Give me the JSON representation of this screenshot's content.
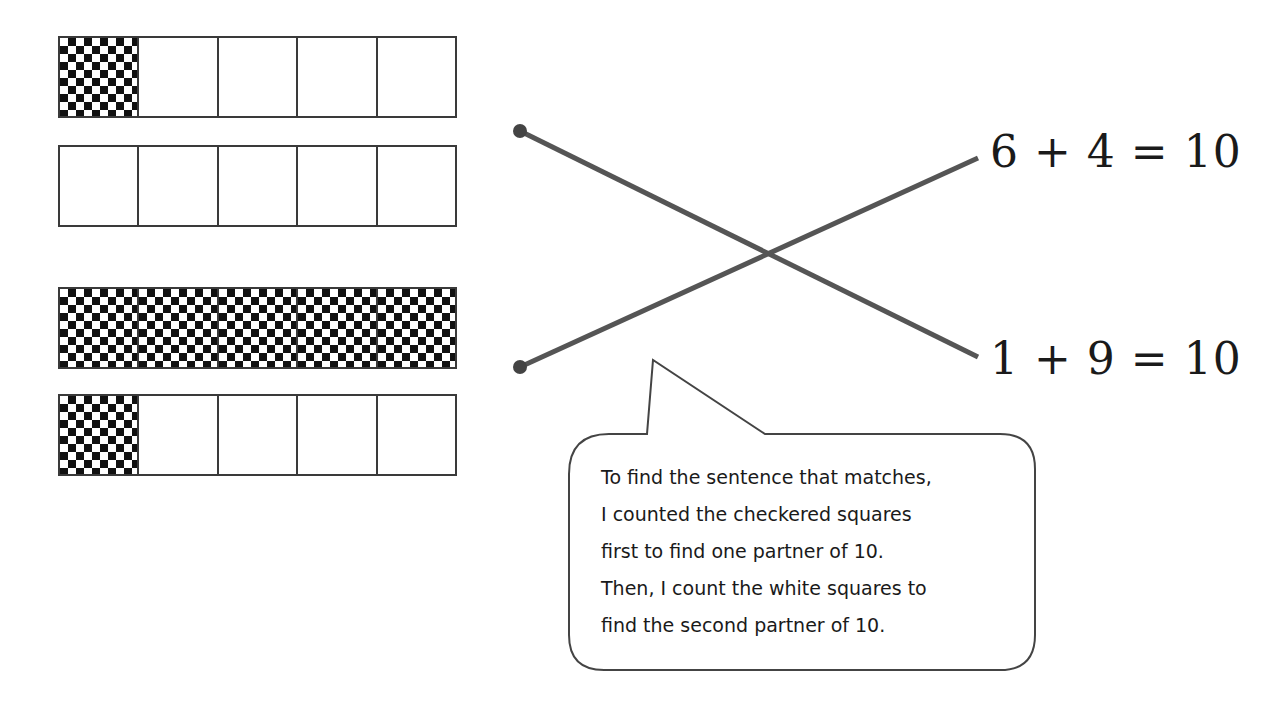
{
  "ten_frames": [
    {
      "id": "frame-1",
      "top": 36,
      "cells": [
        "checkered",
        "white",
        "white",
        "white",
        "white"
      ],
      "checkered_count": 1,
      "white_count": 4
    },
    {
      "id": "frame-2",
      "top": 145,
      "cells": [
        "white",
        "white",
        "white",
        "white",
        "white"
      ],
      "checkered_count": 0,
      "white_count": 5
    },
    {
      "id": "frame-3",
      "top": 287,
      "cells": [
        "checkered",
        "checkered",
        "checkered",
        "checkered",
        "checkered"
      ],
      "checkered_count": 5,
      "white_count": 0
    },
    {
      "id": "frame-4",
      "top": 394,
      "cells": [
        "checkered",
        "white",
        "white",
        "white",
        "white"
      ],
      "checkered_count": 1,
      "white_count": 4
    }
  ],
  "groups": [
    {
      "name": "top-group",
      "frames": [
        "frame-1",
        "frame-2"
      ],
      "checkered": 1,
      "white": 9,
      "matches": "1 + 9 = 10"
    },
    {
      "name": "bottom-group",
      "frames": [
        "frame-3",
        "frame-4"
      ],
      "checkered": 6,
      "white": 4,
      "matches": "6 + 4 = 10"
    }
  ],
  "equations": [
    {
      "text": "6 + 4 = 10",
      "left": 990,
      "top": 126
    },
    {
      "text": "1 + 9 = 10",
      "left": 990,
      "top": 333
    }
  ],
  "connector_lines": [
    {
      "from": [
        520,
        131
      ],
      "to": [
        978,
        357
      ],
      "label": "top-group to 1 + 9 = 10"
    },
    {
      "from": [
        520,
        367
      ],
      "to": [
        978,
        158
      ],
      "label": "bottom-group to 6 + 4 = 10"
    }
  ],
  "colors": {
    "line": "#555555",
    "checker": "#111111",
    "frame_border": "#3a3a3a",
    "bubble_border": "#444444"
  },
  "speech_bubble": {
    "lines": [
      "To find the sentence that matches,",
      "I counted the checkered squares",
      "first to find one partner of 10.",
      "Then, I count the white squares to",
      "find the second partner of 10."
    ]
  }
}
